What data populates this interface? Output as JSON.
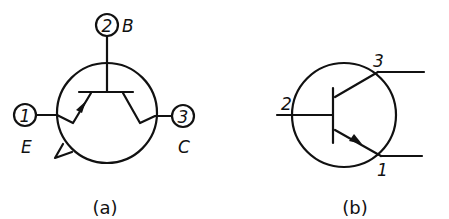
{
  "diagram_a": {
    "caption": "(a)",
    "pins": [
      {
        "number": "1",
        "name": "E"
      },
      {
        "number": "2",
        "name": "B"
      },
      {
        "number": "3",
        "name": "C"
      }
    ]
  },
  "diagram_b": {
    "caption": "(b)",
    "pins": [
      {
        "number": "2",
        "role": "base"
      },
      {
        "number": "3",
        "role": "collector"
      },
      {
        "number": "1",
        "role": "emitter"
      }
    ]
  }
}
